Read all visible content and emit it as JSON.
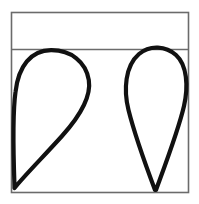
{
  "figure": {
    "background_color": "#ffffff",
    "canvas": {
      "width": 199,
      "height": 204
    },
    "frame": {
      "name": "outer-rectangle",
      "x": 11.5,
      "y": 12.5,
      "width": 177,
      "height": 180,
      "stroke_color": "#6b6b6b",
      "stroke_width": 1.6,
      "fill": "none"
    },
    "divider": {
      "name": "horizontal-divider-line",
      "x1": 11.5,
      "y1": 49.5,
      "x2": 188.5,
      "y2": 49.5,
      "stroke_color": "#6b6b6b",
      "stroke_width": 1.6,
      "band_label": "top band",
      "band_height": 37
    },
    "shapes": [
      {
        "name": "left-teardrop",
        "description": "Teardrop with rounded bulb at top touching the divider and a sharp point at the bottom-left corner",
        "stroke_color": "#111111",
        "stroke_width": 4.2,
        "fill": "none",
        "bulb_top_x": 50,
        "bulb_top_y": 50,
        "left_extent_x": 14,
        "right_extent_x": 89,
        "right_extent_y": 85,
        "tip_x": 14,
        "tip_y": 190,
        "path": "M 14.5 186 C 13.2 150 13.0 110 15.5 92 C 18.5 66 31 50.5 51 50.2 C 71 50.0 86 62 88.8 80 C 91.5 97 80 116 62 136 C 44 156 24 176 14.5 188 Z"
      },
      {
        "name": "right-teardrop",
        "description": "Teardrop with rounded bulb at top crossing the divider and a sharp point at the bottom",
        "stroke_color": "#111111",
        "stroke_width": 4.2,
        "fill": "none",
        "bulb_top_x": 157,
        "bulb_top_y": 48,
        "left_extent_x": 126,
        "right_extent_x": 187,
        "right_extent_y": 90,
        "tip_x": 155,
        "tip_y": 192,
        "path": "M 155 190 C 146 166 134 132 128.5 110 C 123.5 90 125 66 139 54 C 150 44.5 166 46 176 55 C 187 65 188.5 86 184 106 C 178.5 130 164 168 156 190 Z"
      }
    ]
  }
}
